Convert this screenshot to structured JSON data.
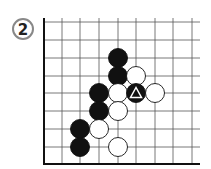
{
  "diagram": {
    "label": "2",
    "board": {
      "cols_x": [
        44,
        62,
        80,
        99,
        118,
        136,
        155,
        173,
        192
      ],
      "rows_y": [
        22,
        40,
        58,
        76,
        93,
        111,
        129,
        147
      ],
      "left_edge_x": 44,
      "bottom_edge_y": 164,
      "right_extent_x": 200,
      "top_extent_y": 18,
      "line_color": "#555555",
      "edge_color": "#111111"
    },
    "stones": [
      {
        "color": "black",
        "x": 118,
        "y": 58
      },
      {
        "color": "black",
        "x": 118,
        "y": 76
      },
      {
        "color": "white",
        "x": 136,
        "y": 76
      },
      {
        "color": "black",
        "x": 99,
        "y": 93
      },
      {
        "color": "white",
        "x": 118,
        "y": 93
      },
      {
        "color": "black",
        "x": 136,
        "y": 93,
        "marker": "triangle"
      },
      {
        "color": "white",
        "x": 155,
        "y": 93
      },
      {
        "color": "black",
        "x": 99,
        "y": 111
      },
      {
        "color": "white",
        "x": 118,
        "y": 111
      },
      {
        "color": "black",
        "x": 80,
        "y": 129
      },
      {
        "color": "white",
        "x": 99,
        "y": 129
      },
      {
        "color": "black",
        "x": 80,
        "y": 147
      },
      {
        "color": "white",
        "x": 118,
        "y": 147
      }
    ],
    "stone_radius": 9.5
  }
}
